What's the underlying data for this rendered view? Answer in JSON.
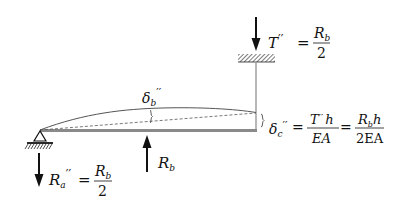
{
  "diagram": {
    "type": "structural-beam-deflection",
    "labels": {
      "tension": {
        "symbol": "T",
        "prime": "′′",
        "equals": "=",
        "numerator_main": "R",
        "numerator_sub": "b",
        "denominator": "2"
      },
      "beam_deflection": {
        "symbol": "δ",
        "sub": "b",
        "prime": "′′"
      },
      "rod_elongation": {
        "symbol": "δ",
        "sub": "c",
        "prime": "′′",
        "eq1": "=",
        "frac1_num_main": "T",
        "frac1_num_prime": "′′",
        "frac1_num_tail": "h",
        "frac1_den": "EA",
        "eq2": "=",
        "frac2_num_main": "R",
        "frac2_num_sub": "b",
        "frac2_num_tail": "h",
        "frac2_den": "2EA"
      },
      "applied_force": {
        "symbol": "R",
        "sub": "b"
      },
      "reaction_a": {
        "symbol": "R",
        "sub": "a",
        "prime": "′′",
        "equals": "=",
        "numerator_main": "R",
        "numerator_sub": "b",
        "denominator": "2"
      }
    },
    "colors": {
      "ink": "#111111",
      "beam": "#8a8a8a",
      "rod": "#9a9a9a",
      "curve": "#444444"
    }
  }
}
